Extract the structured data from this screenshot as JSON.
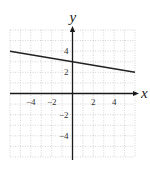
{
  "chart_data": {
    "type": "line",
    "title": "",
    "xlabel": "x",
    "ylabel": "y",
    "xlim": [
      -6,
      6
    ],
    "ylim": [
      -6,
      6
    ],
    "grid": true,
    "grid_style": "dotted, 1-unit spacing",
    "x_ticks": [
      -4,
      -2,
      2,
      4
    ],
    "y_ticks": [
      4,
      2,
      -2,
      -4
    ],
    "x_tick_labels": [
      "−4",
      "−2",
      "2",
      "4"
    ],
    "y_tick_labels": [
      "4",
      "2",
      "−2",
      "−4"
    ],
    "series": [
      {
        "name": "line",
        "equation": "y = -x/6 + 3",
        "x": [
          -6,
          6
        ],
        "y": [
          4,
          2
        ]
      }
    ],
    "legend": null
  },
  "colors": {
    "axis": "#1a1a1a",
    "line": "#222222",
    "grid": "#b8b8b8"
  }
}
